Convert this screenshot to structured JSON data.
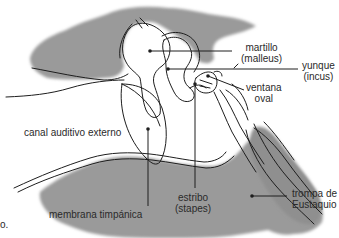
{
  "diagram": {
    "colors": {
      "tissue": "#9a9a9a",
      "outline": "#1e1e1e",
      "background": "#ffffff",
      "text": "#2a2a2a"
    },
    "labels": {
      "martillo": {
        "line1": "martillo",
        "line2": "(malleus)"
      },
      "yunque": {
        "line1": "yunque",
        "line2": "(incus)"
      },
      "ventana_oval": {
        "line1": "ventana",
        "line2": "oval"
      },
      "canal_auditivo": {
        "text": "canal auditivo externo"
      },
      "membrana_timpanica": {
        "text": "membrana timpánica"
      },
      "estribo": {
        "line1": "estribo",
        "line2": "(stapes)"
      },
      "trompa": {
        "line1": "trompa de",
        "line2": "Eustaquio"
      },
      "cut_fragment": {
        "text": "o."
      }
    }
  }
}
